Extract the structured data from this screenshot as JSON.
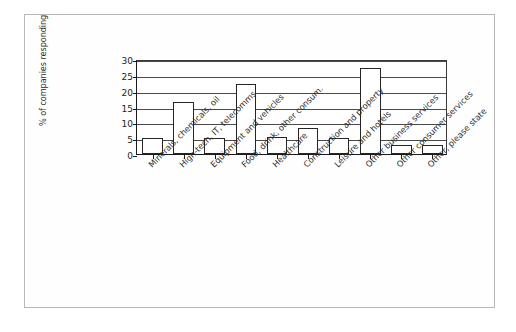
{
  "chart_data": {
    "type": "bar",
    "title": "",
    "subtitle": "",
    "xlabel": "",
    "ylabel": "% of companies responding",
    "ylim": [
      0,
      30
    ],
    "yticks": [
      0,
      5,
      10,
      15,
      20,
      25,
      30
    ],
    "ytick_labels": [
      "0",
      "5",
      "10",
      "15",
      "20",
      "25",
      "30"
    ],
    "grid": true,
    "grid_axis": "y",
    "legend": false,
    "legend_position": "none",
    "bar_fill": "#ffffff",
    "bar_edge": "#252525",
    "categories": [
      "Minerals, chemicals, oil",
      "High-tech, IT, telecomms",
      "Equipment and vehicles",
      "Food, drink, other consum.",
      "Healthcare",
      "Construction and property",
      "Leisure and hotels",
      "Other business services",
      "Other consumer services",
      "Other, please state"
    ],
    "values": [
      5.1,
      16.5,
      5.1,
      22.2,
      5.3,
      8.2,
      5.1,
      27.3,
      2.7,
      2.7
    ]
  },
  "figure": {
    "frame_color": "#b8b8b8",
    "background": "#ffffff",
    "axis_color": "#1a1a1a"
  }
}
